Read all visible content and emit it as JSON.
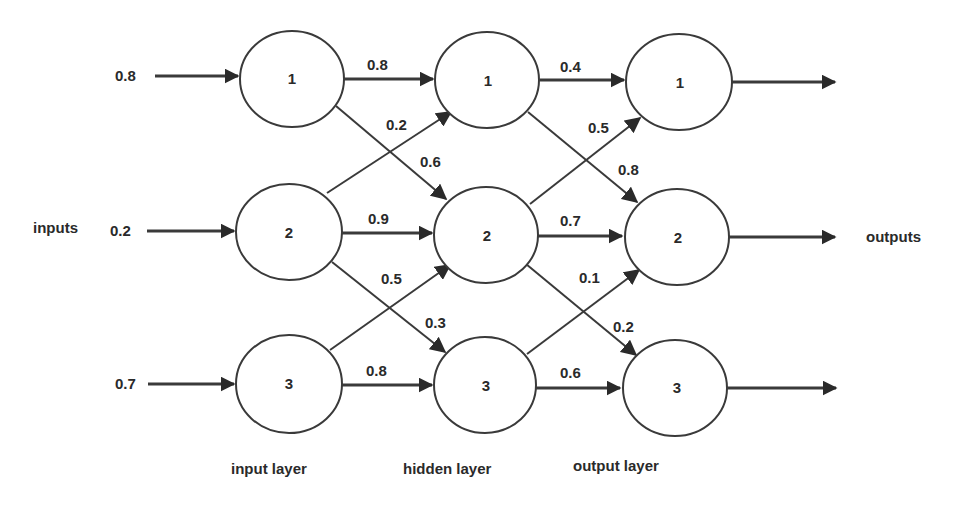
{
  "diagram": {
    "title": "",
    "side_labels": {
      "inputs": "inputs",
      "outputs": "outputs"
    },
    "layers": [
      {
        "id": "input",
        "label": "input layer",
        "nodes": [
          "1",
          "2",
          "3"
        ]
      },
      {
        "id": "hidden",
        "label": "hidden layer",
        "nodes": [
          "1",
          "2",
          "3"
        ]
      },
      {
        "id": "output",
        "label": "output layer",
        "nodes": [
          "1",
          "2",
          "3"
        ]
      }
    ],
    "input_values": [
      "0.8",
      "0.2",
      "0.7"
    ],
    "weights_input_hidden": {
      "i1_h1": "0.8",
      "i2_h1": "0.2",
      "i1_h2": "0.6",
      "i2_h2": "0.9",
      "i3_h2": "0.5",
      "i2_h3": "0.3",
      "i3_h3": "0.8"
    },
    "weights_hidden_output": {
      "h1_o1": "0.4",
      "h2_o1": "0.5",
      "h1_o2": "0.8",
      "h2_o2": "0.7",
      "h3_o2": "0.1",
      "h2_o3": "0.2",
      "h3_o3": "0.6"
    },
    "colors": {
      "stroke": "#3a3a3a",
      "text": "#2a2a2a",
      "background": "#ffffff"
    }
  }
}
